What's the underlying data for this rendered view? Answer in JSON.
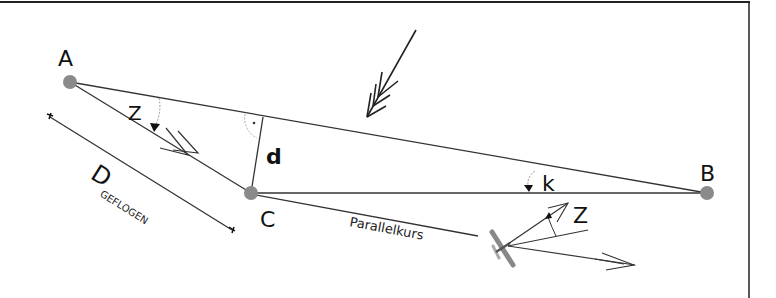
{
  "diagram": {
    "colors": {
      "line": "#333333",
      "point": "#8a8a8a",
      "text": "#111111",
      "frame": "#222222",
      "arc": "#aaaaaa"
    },
    "points": {
      "A": {
        "label": "A",
        "x": 70,
        "y": 82
      },
      "B": {
        "label": "B",
        "x": 707,
        "y": 193
      },
      "C": {
        "label": "C",
        "x": 251,
        "y": 193
      }
    },
    "labels": {
      "z_top": "Z",
      "d": "d",
      "k": "k",
      "z_plane": "Z",
      "distance_main": "D",
      "distance_sub": "GEFLOGEN",
      "parallel_course": "Parallelkurs"
    },
    "icons": {
      "wind_arrow": "wind-arrow-icon",
      "airplane": "airplane-icon",
      "right_angle": "right-angle-marker-icon"
    }
  }
}
